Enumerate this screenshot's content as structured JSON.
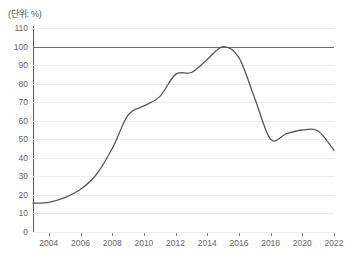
{
  "unit_label": "(단위: %)",
  "colors": {
    "line": "#585858",
    "grid": "#ededed",
    "reference_line": "#6b6b6b",
    "axis": "#5a5a5a",
    "tick_text": "#666666",
    "background": "#ffffff"
  },
  "chart_data": {
    "type": "line",
    "title": "",
    "subtitle": "",
    "xlabel": "",
    "ylabel": "",
    "unit": "%",
    "grid": true,
    "legend": false,
    "legend_position": "none",
    "xlim": [
      2003,
      2022
    ],
    "ylim": [
      0,
      110
    ],
    "ytick_values": [
      0,
      10,
      20,
      30,
      40,
      50,
      60,
      70,
      80,
      90,
      100,
      110
    ],
    "ytick_labels": [
      "0",
      "10",
      "20",
      "30",
      "40",
      "50",
      "60",
      "70",
      "80",
      "90",
      "100",
      "110"
    ],
    "xtick_values": [
      2004,
      2006,
      2008,
      2010,
      2012,
      2014,
      2016,
      2018,
      2020,
      2022
    ],
    "xtick_labels": [
      "2004",
      "2006",
      "2008",
      "2010",
      "2012",
      "2014",
      "2016",
      "2018",
      "2020",
      "2022"
    ],
    "reference_line": {
      "value": 100,
      "emphasized": true
    },
    "x": [
      2003,
      2004,
      2005,
      2006,
      2007,
      2008,
      2009,
      2010,
      2011,
      2012,
      2013,
      2014,
      2015,
      2016,
      2017,
      2018,
      2019,
      2020,
      2021,
      2022
    ],
    "series": [
      {
        "name": "비율",
        "values": [
          15.5,
          16.0,
          18.5,
          23.0,
          31.0,
          45.0,
          63.0,
          68.0,
          73.0,
          85.0,
          86.0,
          93.0,
          100.0,
          94.0,
          72.0,
          50.0,
          53.0,
          55.0,
          54.5,
          44.0
        ]
      }
    ]
  }
}
